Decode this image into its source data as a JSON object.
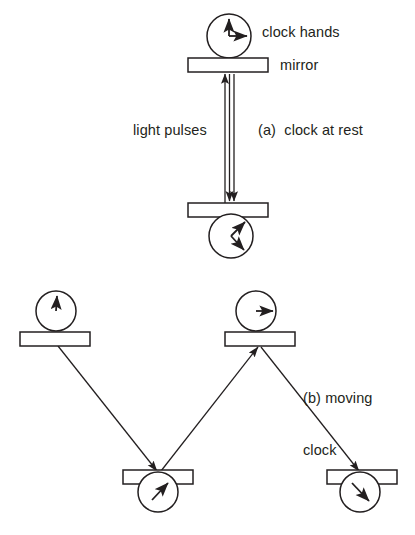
{
  "figure": {
    "stroke_color": "#231f20",
    "fill_color": "#ffffff",
    "background": "#ffffff"
  },
  "labels": {
    "clock_hands": "clock hands",
    "mirror": "mirror",
    "light_pulses": "light pulses",
    "caption_a": "(a)  clock at rest",
    "caption_b_line1": "(b) moving",
    "caption_b_line2": "clock"
  },
  "panel_a": {
    "name": "clock at rest",
    "mirrors": [
      {
        "id": "top-mirror",
        "x": 188,
        "y": 58,
        "w": 80,
        "h": 14
      },
      {
        "id": "bottom-mirror",
        "x": 188,
        "y": 203,
        "w": 80,
        "h": 14
      }
    ],
    "clocks": [
      {
        "id": "top-clock",
        "cx": 229,
        "cy": 36,
        "r": 22,
        "hands": [
          "12",
          "3"
        ]
      },
      {
        "id": "bottom-clock",
        "cx": 231,
        "cy": 236,
        "r": 22,
        "hands": [
          "1:30",
          "4:30"
        ]
      }
    ],
    "light_path": {
      "type": "vertical-double-beam",
      "x_left": 225,
      "x_right": 233,
      "y_top": 72,
      "y_bottom": 203,
      "arrow_up_count": 1,
      "arrow_down_count": 2
    }
  },
  "panel_b": {
    "name": "moving clock",
    "mirrors": [
      {
        "id": "top-left-mirror",
        "x": 20,
        "y": 332,
        "w": 70,
        "h": 14
      },
      {
        "id": "top-right-mirror",
        "x": 225,
        "y": 332,
        "w": 70,
        "h": 14
      },
      {
        "id": "bottom-middle-mirror",
        "x": 123,
        "y": 470,
        "w": 70,
        "h": 14
      },
      {
        "id": "bottom-right-mirror",
        "x": 327,
        "y": 470,
        "w": 70,
        "h": 14
      }
    ],
    "clocks": [
      {
        "id": "clock-top-left",
        "cx": 56,
        "cy": 311,
        "r": 20,
        "hands": [
          "12"
        ]
      },
      {
        "id": "clock-top-right",
        "cx": 256,
        "cy": 311,
        "r": 20,
        "hands": [
          "3"
        ]
      },
      {
        "id": "clock-bottom-middle",
        "cx": 158,
        "cy": 492,
        "r": 20,
        "hands": [
          "1:30"
        ]
      },
      {
        "id": "clock-bottom-right",
        "cx": 360,
        "cy": 492,
        "r": 20,
        "hands": [
          "4:30"
        ]
      }
    ],
    "light_path": {
      "type": "zigzag",
      "segments": [
        {
          "from": "top-left-mirror",
          "to": "bottom-middle-mirror",
          "x1": 58,
          "y1": 346,
          "x2": 156,
          "y2": 470
        },
        {
          "from": "bottom-middle-mirror",
          "to": "top-right-mirror",
          "x1": 160,
          "y1": 470,
          "x2": 257,
          "y2": 346
        },
        {
          "from": "top-right-mirror",
          "to": "bottom-right-mirror",
          "x1": 259,
          "y1": 346,
          "x2": 358,
          "y2": 470
        }
      ]
    }
  }
}
